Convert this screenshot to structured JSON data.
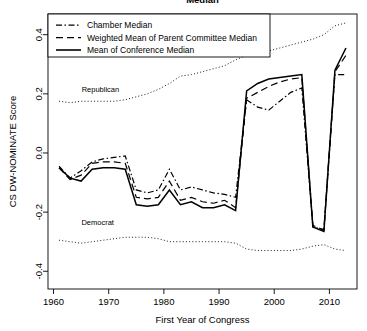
{
  "chart_data": {
    "type": "line",
    "title": "Median",
    "xlabel": "First Year of Congress",
    "ylabel": "CS DW-NOMINATE Score",
    "xlim": [
      1959,
      2015
    ],
    "ylim": [
      -0.46,
      0.47
    ],
    "xticks": [
      1960,
      1970,
      1980,
      1990,
      2000,
      2010
    ],
    "yticks": [
      -0.4,
      -0.2,
      0.0,
      0.2,
      0.4
    ],
    "ytick_labels": [
      "-0.4",
      "-0.2",
      "0.0",
      "0.2",
      "0.4"
    ],
    "xtick_labels": [
      "1960",
      "1970",
      "1980",
      "1990",
      "2000",
      "2010"
    ],
    "grid": false,
    "legend_position": "top-left",
    "annotations": [
      {
        "text": "Republican",
        "x": 1968.5,
        "y": 0.205
      },
      {
        "text": "Democrat",
        "x": 1968.0,
        "y": -0.245
      }
    ],
    "series": [
      {
        "name": "Chamber Median",
        "style": "dashdot",
        "x": [
          1961,
          1963,
          1965,
          1967,
          1969,
          1971,
          1973,
          1975,
          1977,
          1979,
          1981,
          1983,
          1985,
          1987,
          1989,
          1991,
          1993,
          1995,
          1997,
          1999,
          2001,
          2003,
          2005,
          2007,
          2009,
          2011,
          2013
        ],
        "values": [
          -0.045,
          -0.085,
          -0.06,
          -0.03,
          -0.02,
          -0.015,
          -0.01,
          -0.125,
          -0.135,
          -0.125,
          -0.055,
          -0.125,
          -0.115,
          -0.125,
          -0.135,
          -0.14,
          -0.15,
          0.18,
          0.155,
          0.145,
          0.175,
          0.205,
          0.22,
          -0.25,
          -0.26,
          0.265,
          0.265
        ]
      },
      {
        "name": "Weighted Mean of Parent Committee Median",
        "style": "dashed",
        "x": [
          1961,
          1963,
          1965,
          1967,
          1969,
          1971,
          1973,
          1975,
          1977,
          1979,
          1981,
          1983,
          1985,
          1987,
          1989,
          1991,
          1993,
          1995,
          1997,
          1999,
          2001,
          2003,
          2005,
          2007,
          2009,
          2011,
          2013
        ],
        "values": [
          -0.05,
          -0.09,
          -0.075,
          -0.035,
          -0.03,
          -0.03,
          -0.035,
          -0.15,
          -0.155,
          -0.15,
          -0.095,
          -0.16,
          -0.15,
          -0.165,
          -0.17,
          -0.16,
          -0.185,
          0.185,
          0.205,
          0.225,
          0.24,
          0.25,
          0.255,
          -0.245,
          -0.26,
          0.275,
          0.33
        ]
      },
      {
        "name": "Mean of Conference Median",
        "style": "solid",
        "x": [
          1961,
          1963,
          1965,
          1967,
          1969,
          1971,
          1973,
          1975,
          1977,
          1979,
          1981,
          1983,
          1985,
          1987,
          1989,
          1991,
          1993,
          1995,
          1997,
          1999,
          2001,
          2003,
          2005,
          2007,
          2009,
          2011,
          2013
        ],
        "values": [
          -0.05,
          -0.085,
          -0.095,
          -0.055,
          -0.05,
          -0.05,
          -0.055,
          -0.175,
          -0.18,
          -0.175,
          -0.125,
          -0.175,
          -0.165,
          -0.185,
          -0.185,
          -0.175,
          -0.195,
          0.21,
          0.235,
          0.25,
          0.255,
          0.26,
          0.265,
          -0.25,
          -0.265,
          0.28,
          0.355
        ]
      },
      {
        "name": "Republican",
        "style": "dotted",
        "x": [
          1961,
          1963,
          1965,
          1967,
          1969,
          1971,
          1973,
          1975,
          1977,
          1979,
          1981,
          1983,
          1985,
          1987,
          1989,
          1991,
          1993,
          1995,
          1997,
          1999,
          2001,
          2003,
          2005,
          2007,
          2009,
          2011,
          2013
        ],
        "values": [
          0.175,
          0.17,
          0.175,
          0.175,
          0.175,
          0.175,
          0.18,
          0.19,
          0.2,
          0.215,
          0.235,
          0.26,
          0.265,
          0.275,
          0.285,
          0.295,
          0.315,
          0.33,
          0.34,
          0.345,
          0.355,
          0.365,
          0.375,
          0.385,
          0.4,
          0.43,
          0.44
        ]
      },
      {
        "name": "Democrat",
        "style": "dotted",
        "x": [
          1961,
          1963,
          1965,
          1967,
          1969,
          1971,
          1973,
          1975,
          1977,
          1979,
          1981,
          1983,
          1985,
          1987,
          1989,
          1991,
          1993,
          1995,
          1997,
          1999,
          2001,
          2003,
          2005,
          2007,
          2009,
          2011,
          2013
        ],
        "values": [
          -0.295,
          -0.3,
          -0.305,
          -0.3,
          -0.295,
          -0.29,
          -0.285,
          -0.285,
          -0.285,
          -0.29,
          -0.3,
          -0.3,
          -0.3,
          -0.3,
          -0.3,
          -0.3,
          -0.305,
          -0.325,
          -0.33,
          -0.33,
          -0.33,
          -0.33,
          -0.325,
          -0.315,
          -0.31,
          -0.325,
          -0.33
        ]
      }
    ],
    "legend": [
      {
        "label": "Chamber Median",
        "style": "dashdot"
      },
      {
        "label": "Weighted Mean of Parent Committee Median",
        "style": "dashed"
      },
      {
        "label": "Mean of Conference Median",
        "style": "solid"
      }
    ]
  }
}
